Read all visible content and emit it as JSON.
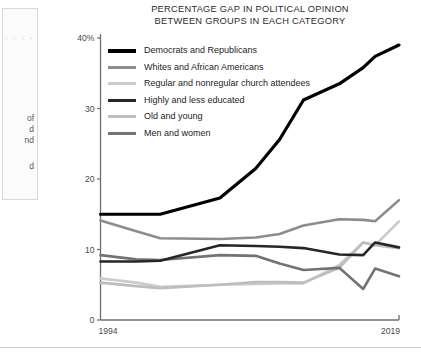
{
  "sidebar": {
    "dots": "· · · ·",
    "fragments": [
      {
        "text": "of",
        "top": 104
      },
      {
        "text": "d",
        "top": 115
      },
      {
        "text": "nd",
        "top": 126
      },
      {
        "text": "d",
        "top": 152
      }
    ]
  },
  "chart_data": {
    "type": "line",
    "title": "PERCENTAGE GAP IN POLITICAL OPINION BETWEEN GROUPS IN EACH CATEGORY",
    "title_lines": [
      "PERCENTAGE GAP IN POLITICAL OPINION",
      "BETWEEN GROUPS IN EACH CATEGORY"
    ],
    "xlabel": "",
    "ylabel": "",
    "xlim": [
      1994,
      2019
    ],
    "ylim": [
      0,
      40
    ],
    "grid": false,
    "legend_position": "top-left-inside",
    "xticks": [
      1994,
      2019
    ],
    "xticklabels": [
      "1994",
      "2019"
    ],
    "yticks": [
      0,
      10,
      20,
      30,
      40
    ],
    "yticklabels": [
      "0",
      "10",
      "20",
      "30",
      "40%"
    ],
    "x": [
      1994,
      1997,
      1999,
      2004,
      2007,
      2009,
      2011,
      2014,
      2016,
      2017,
      2019
    ],
    "series": [
      {
        "name": "Democrats and Republicans",
        "color": "#000000",
        "width": 3.2,
        "values": [
          15.0,
          15.0,
          15.0,
          17.3,
          21.5,
          25.6,
          31.2,
          33.5,
          35.8,
          37.4,
          39.0
        ]
      },
      {
        "name": "Whites and African Americans",
        "color": "#8c8c8c",
        "width": 2.6,
        "values": [
          14.1,
          12.6,
          11.6,
          11.5,
          11.7,
          12.2,
          13.4,
          14.3,
          14.2,
          14.0,
          17.0
        ]
      },
      {
        "name": "Regular and nonregular church attendees",
        "color": "#cccccc",
        "width": 2.6,
        "values": [
          5.9,
          5.3,
          4.7,
          5.0,
          5.1,
          5.2,
          5.2,
          7.8,
          11.0,
          10.6,
          14.0
        ]
      },
      {
        "name": "Highly and less educated",
        "color": "#262626",
        "width": 2.6,
        "values": [
          8.3,
          8.3,
          8.4,
          10.6,
          10.5,
          10.4,
          10.2,
          9.3,
          9.2,
          11.0,
          10.3
        ]
      },
      {
        "name": "Old and young",
        "color": "#bdbdbd",
        "width": 2.6,
        "values": [
          5.3,
          4.8,
          4.5,
          5.0,
          5.4,
          5.4,
          5.3,
          7.4,
          11.0,
          10.6,
          10.2
        ]
      },
      {
        "name": "Men and women",
        "color": "#737373",
        "width": 2.6,
        "values": [
          9.2,
          8.6,
          8.5,
          9.2,
          9.1,
          8.0,
          7.1,
          7.4,
          4.4,
          7.3,
          6.2
        ]
      }
    ]
  }
}
